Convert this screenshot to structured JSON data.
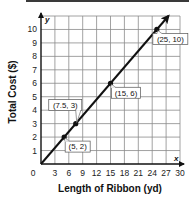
{
  "chart_data": {
    "type": "line",
    "title": "",
    "xlabel": "Length of Ribbon (yd)",
    "ylabel": "Total Cost ($)",
    "x_axis_letter": "x",
    "y_axis_letter": "y",
    "xlim": [
      0,
      30
    ],
    "ylim": [
      0,
      11
    ],
    "x_ticks": [
      0,
      3,
      6,
      9,
      12,
      15,
      18,
      21,
      24,
      27,
      30
    ],
    "y_ticks": [
      1,
      2,
      3,
      4,
      5,
      6,
      7,
      8,
      9,
      10
    ],
    "grid": true,
    "series": [
      {
        "name": "Total Cost",
        "line": {
          "from": [
            0,
            0
          ],
          "to": [
            27.5,
            11
          ],
          "arrow": true
        },
        "points": [
          {
            "x": 5,
            "y": 2,
            "label": "(5, 2)"
          },
          {
            "x": 7.5,
            "y": 3,
            "label": "(7.5, 3)"
          },
          {
            "x": 15,
            "y": 6,
            "label": "(15, 6)"
          },
          {
            "x": 25,
            "y": 10,
            "label": "(25, 10)"
          }
        ]
      }
    ]
  },
  "colors": {
    "grid": "#8a8a8a",
    "line": "#111111",
    "text": "#222222",
    "topbar": "#3a3a3a"
  }
}
